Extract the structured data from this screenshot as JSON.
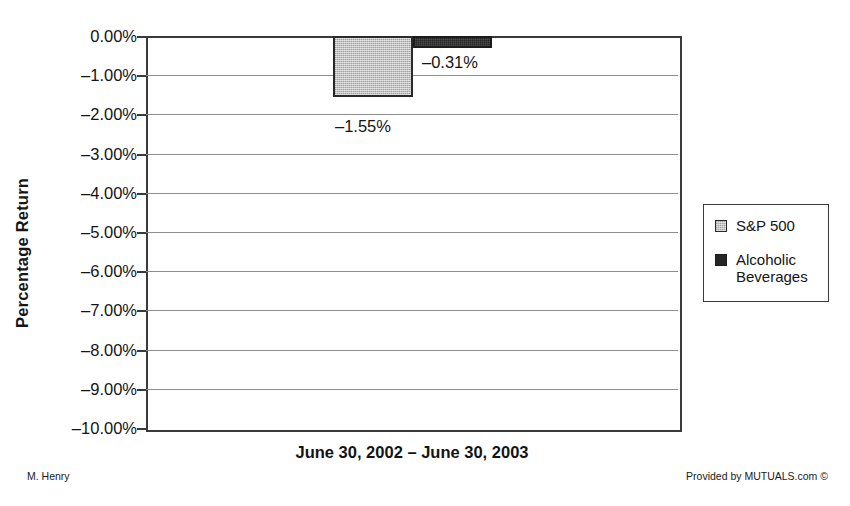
{
  "chart_data": {
    "type": "bar",
    "title": "",
    "xlabel": "June 30, 2002 – June 30, 2003",
    "ylabel": "Percentage Return",
    "ylim": [
      -10.0,
      0.0
    ],
    "ytick_step": 1.0,
    "grid": true,
    "legend_position": "right",
    "categories": [
      "June 30, 2002 – June 30, 2003"
    ],
    "series": [
      {
        "name": "S&P 500",
        "values": [
          -1.55
        ],
        "data_label": "–1.55%",
        "color": "#c3c3c3"
      },
      {
        "name": "Alcoholic Beverages",
        "values": [
          -0.31
        ],
        "data_label": "–0.31%",
        "color": "#262626"
      }
    ],
    "ytick_labels": [
      "0.00%",
      "–1.00%",
      "–2.00%",
      "–3.00%",
      "–4.00%",
      "–5.00%",
      "–6.00%",
      "–7.00%",
      "–8.00%",
      "–9.00%",
      "–10.00%"
    ],
    "ytick_values": [
      0,
      -1,
      -2,
      -3,
      -4,
      -5,
      -6,
      -7,
      -8,
      -9,
      -10
    ]
  },
  "axes": {
    "y_title": "Percentage Return",
    "x_title": "June 30, 2002 – June 30, 2003"
  },
  "legend": {
    "items": [
      {
        "label": "S&P 500",
        "color": "#c3c3c3"
      },
      {
        "label": "Alcoholic Beverages",
        "color": "#262626"
      }
    ]
  },
  "labels": {
    "sp500": "–1.55%",
    "alcohol": "–0.31%"
  },
  "footer": {
    "left": "M. Henry",
    "right": "Provided by MUTUALS.com ©"
  }
}
